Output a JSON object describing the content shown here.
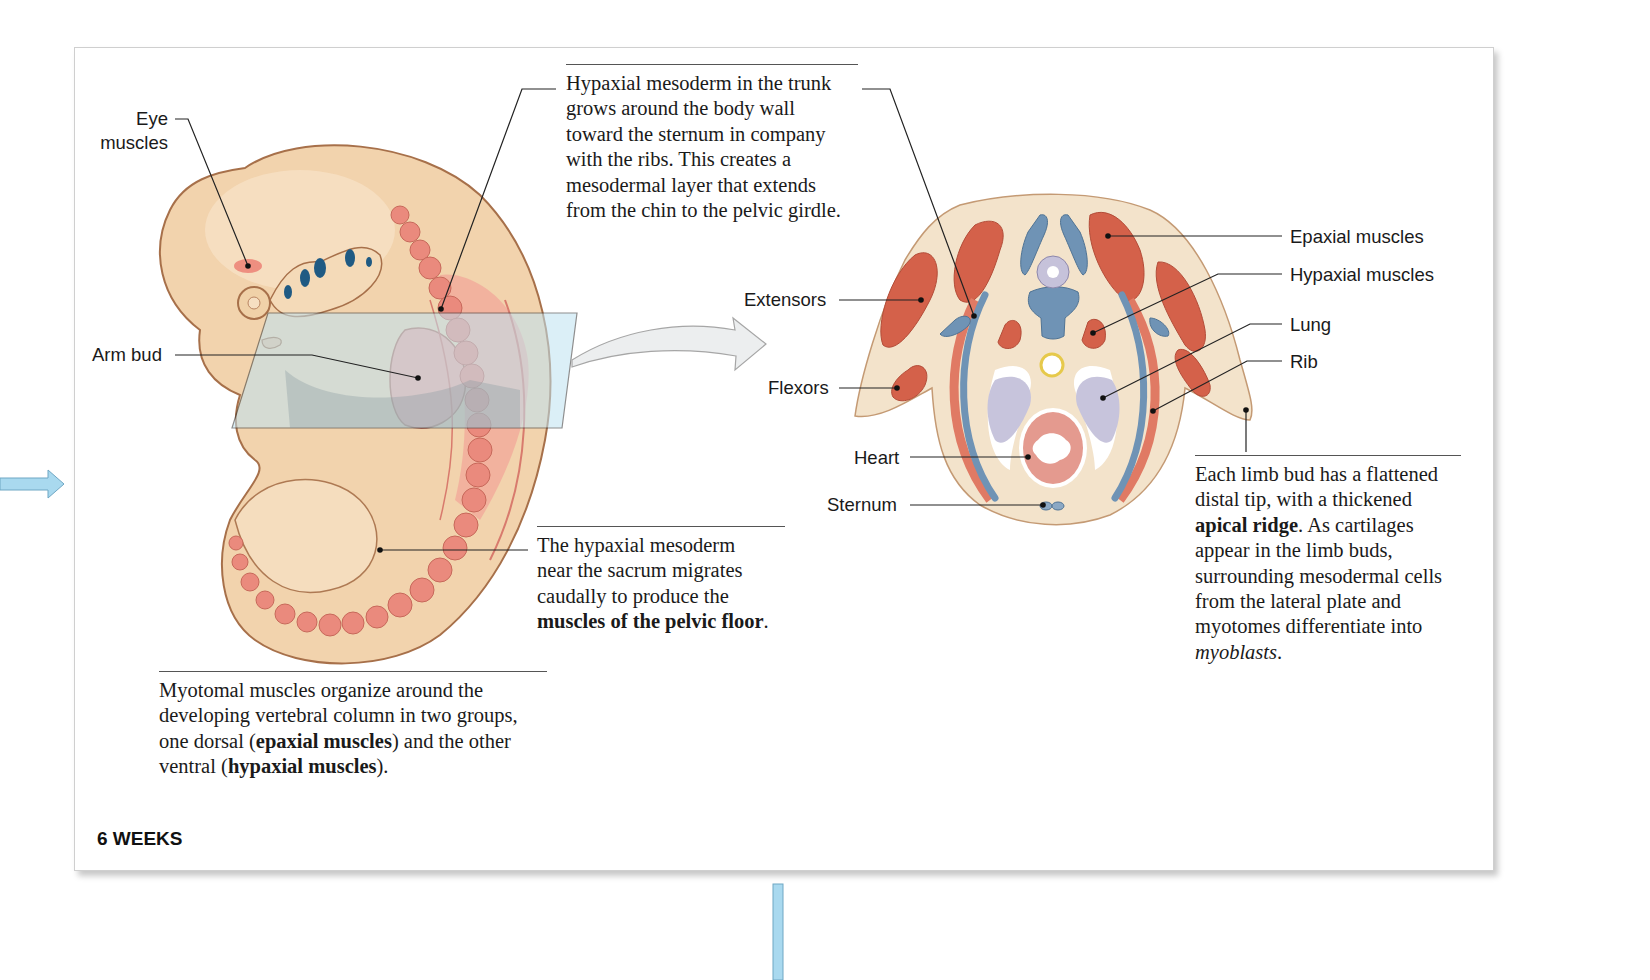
{
  "figure": {
    "stage_label": "6 WEEKS",
    "embryo_labels": {
      "eye_muscles_line1": "Eye",
      "eye_muscles_line2": "muscles",
      "arm_bud": "Arm bud"
    },
    "section_labels": {
      "extensors": "Extensors",
      "flexors": "Flexors",
      "heart": "Heart",
      "sternum": "Sternum",
      "epaxial_muscles": "Epaxial muscles",
      "hypaxial_muscles": "Hypaxial muscles",
      "lung": "Lung",
      "rib": "Rib"
    },
    "captions": {
      "trunk": {
        "lines": [
          "Hypaxial mesoderm in the trunk",
          "grows around the body wall",
          "toward the sternum in company",
          "with the ribs. This creates a",
          "mesodermal layer that extends",
          "from the chin to the pelvic girdle."
        ]
      },
      "sacrum": {
        "line1": "The hypaxial mesoderm",
        "line2": "near the sacrum migrates",
        "line3": "caudally to produce the",
        "bold": "muscles of the pelvic floor",
        "end": "."
      },
      "myotomal": {
        "line1": "Myotomal muscles organize around the",
        "line2": "developing vertebral column in two groups,",
        "line3_pre": "one dorsal (",
        "line3_bold": "epaxial muscles",
        "line3_post": ") and the other",
        "line4_pre": "ventral (",
        "line4_bold": "hypaxial muscles",
        "line4_post": ")."
      },
      "limb_bud": {
        "line1": "Each limb bud has a flattened",
        "line2": "distal tip, with a thickened",
        "line3_bold": "apical ridge",
        "line3_post": ". As cartilages",
        "line4": "appear in the limb buds,",
        "line5": "surrounding mesodermal cells",
        "line6": "from the lateral plate and",
        "line7_pre": "myotomes differentiate into",
        "line8_italic": "myoblasts",
        "line8_post": "."
      }
    },
    "colors": {
      "skin": "#f2d3ad",
      "skin_outline": "#a7704a",
      "somite": "#ea8a7d",
      "muscle": "#d4614a",
      "bone": "#6f93b5",
      "lung": "#c7c4dc",
      "heart": "#e49a8f",
      "plane": "#bfe3f2",
      "flow_arrow": "#a9d9ef"
    }
  }
}
